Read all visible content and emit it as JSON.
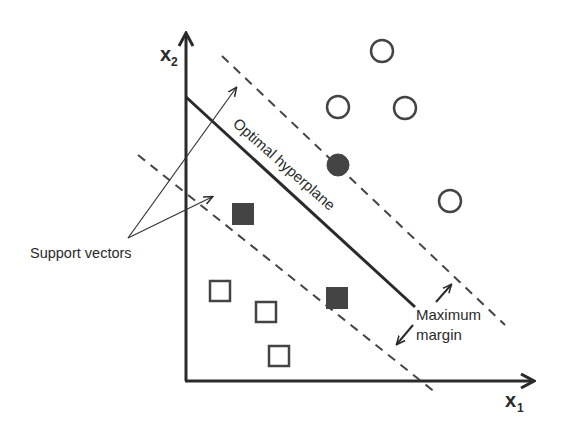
{
  "diagram": {
    "axes": {
      "x_label": "x",
      "x_subscript": "1",
      "y_label": "x",
      "y_subscript": "2"
    },
    "labels": {
      "hyperplane": "Optimal hyperplane",
      "support_vectors": "Support vectors",
      "margin_line1": "Maximum",
      "margin_line2": "margin"
    },
    "colors": {
      "ink": "#2a2a2a",
      "filled": "#444444",
      "background": "#ffffff"
    },
    "class_circles": {
      "hollow": [
        [
          382,
          51
        ],
        [
          338,
          107
        ],
        [
          405,
          108
        ],
        [
          450,
          201
        ]
      ],
      "support": [
        [
          338,
          165
        ]
      ]
    },
    "class_squares": {
      "hollow": [
        [
          220,
          291
        ],
        [
          266,
          312
        ],
        [
          280,
          355
        ]
      ],
      "support": [
        [
          243,
          214
        ],
        [
          337,
          297
        ]
      ]
    }
  }
}
